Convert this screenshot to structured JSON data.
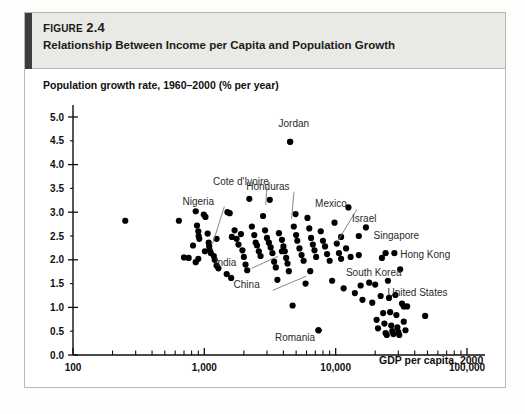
{
  "figure": {
    "number_prefix": "F",
    "number_rest": "IGURE",
    "number_label": "Figure 2.4",
    "number_value": "2.4",
    "title": "Relationship Between Income per Capita and Population Growth"
  },
  "chart_data": {
    "type": "scatter",
    "title": "Relationship Between Income per Capita and Population Growth",
    "xlabel": "GDP per capita, 2000",
    "ylabel": "Population growth rate, 1960–2000 (% per year)",
    "xscale": "log",
    "xlim": [
      100,
      100000
    ],
    "ylim": [
      0.0,
      5.0
    ],
    "grid": false,
    "legend": null,
    "xticks": [
      {
        "value": 100,
        "label": "100"
      },
      {
        "value": 1000,
        "label": "1,000"
      },
      {
        "value": 10000,
        "label": "10,000"
      },
      {
        "value": 100000,
        "label": "100,000"
      }
    ],
    "yticks": [
      {
        "value": 0.0,
        "label": "0.0"
      },
      {
        "value": 0.5,
        "label": "0.5"
      },
      {
        "value": 1.0,
        "label": "1.0"
      },
      {
        "value": 1.5,
        "label": "1.5"
      },
      {
        "value": 2.0,
        "label": "2.0"
      },
      {
        "value": 2.5,
        "label": "2.5"
      },
      {
        "value": 3.0,
        "label": "3.0"
      },
      {
        "value": 3.5,
        "label": "3.5"
      },
      {
        "value": 4.0,
        "label": "4.0"
      },
      {
        "value": 4.5,
        "label": "4.5"
      },
      {
        "value": 5.0,
        "label": "5.0"
      }
    ],
    "points": [
      {
        "x": 250,
        "y": 2.82
      },
      {
        "x": 640,
        "y": 2.82
      },
      {
        "x": 700,
        "y": 2.05
      },
      {
        "x": 860,
        "y": 3.02
      },
      {
        "x": 880,
        "y": 2.72
      },
      {
        "x": 900,
        "y": 2.6
      },
      {
        "x": 905,
        "y": 2.5
      },
      {
        "x": 915,
        "y": 2.44
      },
      {
        "x": 820,
        "y": 2.3
      },
      {
        "x": 990,
        "y": 2.95
      },
      {
        "x": 1010,
        "y": 2.18
      },
      {
        "x": 1020,
        "y": 2.9
      },
      {
        "x": 1060,
        "y": 2.55
      },
      {
        "x": 1080,
        "y": 2.36
      },
      {
        "x": 1090,
        "y": 2.28
      },
      {
        "x": 1100,
        "y": 2.2
      },
      {
        "x": 1120,
        "y": 2.14
      },
      {
        "x": 860,
        "y": 1.95
      },
      {
        "x": 1180,
        "y": 2.08
      },
      {
        "x": 1200,
        "y": 2.0
      },
      {
        "x": 1240,
        "y": 1.88
      },
      {
        "x": 1280,
        "y": 1.82
      },
      {
        "x": 760,
        "y": 2.04
      },
      {
        "x": 900,
        "y": 2.02
      },
      {
        "x": 1500,
        "y": 3.0
      },
      {
        "x": 1560,
        "y": 2.98
      },
      {
        "x": 1620,
        "y": 2.48
      },
      {
        "x": 1700,
        "y": 2.62
      },
      {
        "x": 1760,
        "y": 2.44
      },
      {
        "x": 1820,
        "y": 2.32
      },
      {
        "x": 1900,
        "y": 2.54
      },
      {
        "x": 1950,
        "y": 2.2
      },
      {
        "x": 2000,
        "y": 2.06
      },
      {
        "x": 2060,
        "y": 1.9
      },
      {
        "x": 2120,
        "y": 1.78
      },
      {
        "x": 2200,
        "y": 3.28
      },
      {
        "x": 2300,
        "y": 2.7
      },
      {
        "x": 2400,
        "y": 2.52
      },
      {
        "x": 2460,
        "y": 2.36
      },
      {
        "x": 2520,
        "y": 2.3
      },
      {
        "x": 2600,
        "y": 2.18
      },
      {
        "x": 2680,
        "y": 2.08
      },
      {
        "x": 1480,
        "y": 1.7
      },
      {
        "x": 1600,
        "y": 1.62
      },
      {
        "x": 2800,
        "y": 2.92
      },
      {
        "x": 2900,
        "y": 2.62
      },
      {
        "x": 3000,
        "y": 2.46
      },
      {
        "x": 3100,
        "y": 2.36
      },
      {
        "x": 3200,
        "y": 2.26
      },
      {
        "x": 3300,
        "y": 2.14
      },
      {
        "x": 3400,
        "y": 1.96
      },
      {
        "x": 3500,
        "y": 1.84
      },
      {
        "x": 3600,
        "y": 1.58
      },
      {
        "x": 3700,
        "y": 2.56
      },
      {
        "x": 3900,
        "y": 2.42
      },
      {
        "x": 4000,
        "y": 2.28
      },
      {
        "x": 4100,
        "y": 2.18
      },
      {
        "x": 4200,
        "y": 2.04
      },
      {
        "x": 4300,
        "y": 1.92
      },
      {
        "x": 4400,
        "y": 1.76
      },
      {
        "x": 4500,
        "y": 4.48
      },
      {
        "x": 4700,
        "y": 1.04
      },
      {
        "x": 4800,
        "y": 2.7
      },
      {
        "x": 5000,
        "y": 2.52
      },
      {
        "x": 5100,
        "y": 2.4
      },
      {
        "x": 5300,
        "y": 2.24
      },
      {
        "x": 5500,
        "y": 2.1
      },
      {
        "x": 5700,
        "y": 1.98
      },
      {
        "x": 5900,
        "y": 1.5
      },
      {
        "x": 6100,
        "y": 2.88
      },
      {
        "x": 6300,
        "y": 2.66
      },
      {
        "x": 6500,
        "y": 2.46
      },
      {
        "x": 6700,
        "y": 2.32
      },
      {
        "x": 6900,
        "y": 2.2
      },
      {
        "x": 7100,
        "y": 2.06
      },
      {
        "x": 7400,
        "y": 0.52
      },
      {
        "x": 7700,
        "y": 2.6
      },
      {
        "x": 8000,
        "y": 2.4
      },
      {
        "x": 8300,
        "y": 2.28
      },
      {
        "x": 8600,
        "y": 2.12
      },
      {
        "x": 9000,
        "y": 1.98
      },
      {
        "x": 9400,
        "y": 1.56
      },
      {
        "x": 9800,
        "y": 2.78
      },
      {
        "x": 10200,
        "y": 2.34
      },
      {
        "x": 10600,
        "y": 2.14
      },
      {
        "x": 11000,
        "y": 2.02
      },
      {
        "x": 11500,
        "y": 1.4
      },
      {
        "x": 12000,
        "y": 2.24
      },
      {
        "x": 12500,
        "y": 3.1
      },
      {
        "x": 13000,
        "y": 2.06
      },
      {
        "x": 14000,
        "y": 1.3
      },
      {
        "x": 15000,
        "y": 2.1
      },
      {
        "x": 16000,
        "y": 1.16
      },
      {
        "x": 17000,
        "y": 2.68
      },
      {
        "x": 18000,
        "y": 1.52
      },
      {
        "x": 19000,
        "y": 1.1
      },
      {
        "x": 20000,
        "y": 1.48
      },
      {
        "x": 20500,
        "y": 0.74
      },
      {
        "x": 21000,
        "y": 0.56
      },
      {
        "x": 22000,
        "y": 1.24
      },
      {
        "x": 23000,
        "y": 0.88
      },
      {
        "x": 23500,
        "y": 0.66
      },
      {
        "x": 24000,
        "y": 0.46
      },
      {
        "x": 24500,
        "y": 0.42
      },
      {
        "x": 25000,
        "y": 1.56
      },
      {
        "x": 25500,
        "y": 1.2
      },
      {
        "x": 26000,
        "y": 0.9
      },
      {
        "x": 26500,
        "y": 0.62
      },
      {
        "x": 27000,
        "y": 0.5
      },
      {
        "x": 27500,
        "y": 0.44
      },
      {
        "x": 28000,
        "y": 2.14
      },
      {
        "x": 28500,
        "y": 1.26
      },
      {
        "x": 29000,
        "y": 0.84
      },
      {
        "x": 29500,
        "y": 0.58
      },
      {
        "x": 30000,
        "y": 0.48
      },
      {
        "x": 30500,
        "y": 0.42
      },
      {
        "x": 31000,
        "y": 1.8
      },
      {
        "x": 32000,
        "y": 1.08
      },
      {
        "x": 33000,
        "y": 0.7
      },
      {
        "x": 34000,
        "y": 0.52
      },
      {
        "x": 35000,
        "y": 1.02
      },
      {
        "x": 48000,
        "y": 0.82
      }
    ],
    "annotations": [
      {
        "label": "Jordan",
        "lx": 4800,
        "ly": 4.78,
        "px": 4500,
        "py": 4.48,
        "anchor": "middle",
        "leader": false
      },
      {
        "label": "Cote d'Ivoire",
        "lx": 1900,
        "ly": 3.58,
        "px": 3150,
        "py": 3.26,
        "anchor": "middle",
        "leader": true
      },
      {
        "label": "Honduras",
        "lx": 3050,
        "ly": 3.46,
        "px": 4950,
        "py": 2.96,
        "anchor": "middle",
        "leader": true
      },
      {
        "label": "Nigeria",
        "lx": 900,
        "ly": 3.16,
        "px": 1240,
        "py": 2.44,
        "anchor": "middle",
        "leader": true
      },
      {
        "label": "Mexico",
        "lx": 9200,
        "ly": 3.1,
        "px": 11000,
        "py": 2.48,
        "anchor": "middle",
        "leader": true
      },
      {
        "label": "Israel",
        "lx": 16500,
        "ly": 2.8,
        "px": 15000,
        "py": 2.5,
        "anchor": "middle",
        "leader": false
      },
      {
        "label": "Singapore",
        "lx": 29000,
        "ly": 2.44,
        "px": 24000,
        "py": 2.14,
        "anchor": "middle",
        "leader": false
      },
      {
        "label": "Hong Kong",
        "lx": 31000,
        "ly": 2.04,
        "px": 22500,
        "py": 2.04,
        "anchor": "start",
        "leader": false
      },
      {
        "label": "India",
        "lx": 1450,
        "ly": 1.86,
        "px": 3900,
        "py": 2.18,
        "anchor": "middle",
        "leader": true
      },
      {
        "label": "South Korea",
        "lx": 19500,
        "ly": 1.66,
        "px": 15500,
        "py": 1.46,
        "anchor": "middle",
        "leader": false
      },
      {
        "label": "China",
        "lx": 2100,
        "ly": 1.4,
        "px": 6400,
        "py": 1.76,
        "anchor": "middle",
        "leader": true
      },
      {
        "label": "United States",
        "lx": 42000,
        "ly": 1.24,
        "px": 33000,
        "py": 1.02,
        "anchor": "middle",
        "leader": false
      },
      {
        "label": "Romania",
        "lx": 4900,
        "ly": 0.3,
        "px": 7400,
        "py": 0.52,
        "anchor": "middle",
        "leader": false
      }
    ]
  }
}
